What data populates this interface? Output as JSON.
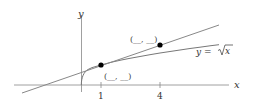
{
  "axes": {
    "x_label": "x",
    "y_label": "y"
  },
  "ticks": [
    {
      "value": 1,
      "label": "1"
    },
    {
      "value": 4,
      "label": "4"
    }
  ],
  "curve": {
    "label": "y = √x",
    "prefix": "y = ",
    "radicand": "x"
  },
  "points": [
    {
      "x": 1,
      "y": 1,
      "label": "(__, __)"
    },
    {
      "x": 4,
      "y": 2,
      "label": "(__, __)"
    }
  ],
  "colors": {
    "line": "#808080",
    "point": "#000000",
    "text": "#333333"
  }
}
